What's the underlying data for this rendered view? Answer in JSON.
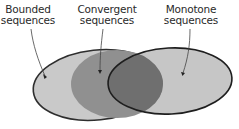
{
  "diagram": {
    "type": "venn",
    "sets": [
      {
        "id": "bounded",
        "line1": "Bounded",
        "line2": "sequences",
        "fill": "#c9c9c9",
        "stroke": "#2e2e2e"
      },
      {
        "id": "convergent",
        "line1": "Convergent",
        "line2": "sequences",
        "fill": "#8f8f8f",
        "stroke": "none"
      },
      {
        "id": "monotone",
        "line1": "Monotone",
        "line2": "sequences",
        "fill": "#c6c6c6",
        "stroke": "#1e1e1e"
      }
    ],
    "overlap_convergent_monotone_fill": "#6e6e6e"
  }
}
